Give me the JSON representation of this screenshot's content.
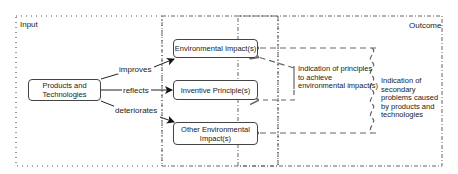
{
  "regions": {
    "input_label": "Input",
    "outcome_label": "Outcome"
  },
  "nodes": {
    "source": "Products and Technologies",
    "env_impact": "Environmental Impact(s)",
    "inventive": "Inventive Principle(s)",
    "other_env": "Other Environmental Impact(s)"
  },
  "edges": {
    "improves": "improves",
    "reflects": "reflects",
    "deteriorates": "deteriorates"
  },
  "annotations": {
    "principles": "Indication of principles to achieve environmental impact(s)",
    "secondary": "Indication of secondary problems caused by products and technologies"
  }
}
